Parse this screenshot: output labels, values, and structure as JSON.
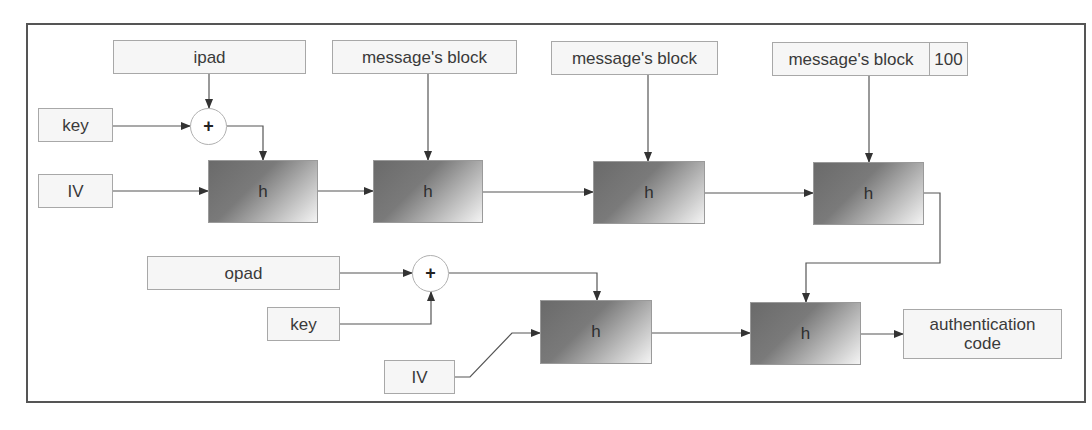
{
  "diagram": {
    "type": "HMAC construction flow diagram",
    "inner_hash": {
      "ipad": "ipad",
      "key": "key",
      "iv": "IV",
      "xor_symbol": "+",
      "blocks": [
        {
          "input": "message's block",
          "function": "h"
        },
        {
          "input": "message's block",
          "function": "h"
        },
        {
          "input": "message's block",
          "padding": "100",
          "function": "h"
        }
      ],
      "first_function": "h"
    },
    "outer_hash": {
      "opad": "opad",
      "key": "key",
      "iv": "IV",
      "xor_symbol": "+",
      "functions": [
        "h",
        "h"
      ]
    },
    "output": "authentication code",
    "colors": {
      "frame": "#555555",
      "label_border": "#a8a8a8",
      "label_fill": "#f6f6f6",
      "h_dark": "#6a6a6a",
      "h_light": "#f4f4f4",
      "wire": "#444444"
    }
  }
}
